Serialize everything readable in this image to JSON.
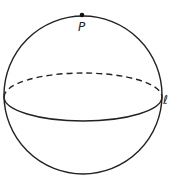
{
  "diagram": {
    "type": "sphere",
    "point_label": "P",
    "line_label": "ℓ",
    "stroke_color": "#222222"
  }
}
